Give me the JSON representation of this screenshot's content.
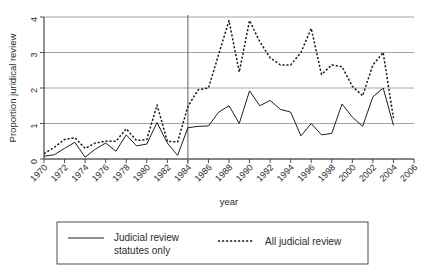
{
  "chart_data": {
    "type": "line",
    "title": "",
    "xlabel": "year",
    "ylabel": "Proportion juridical review",
    "xlim": [
      1970,
      2006
    ],
    "ylim": [
      0,
      4
    ],
    "grid": true,
    "legend_position": "bottom",
    "x_ticks": [
      1970,
      1972,
      1974,
      1976,
      1978,
      1980,
      1982,
      1984,
      1986,
      1988,
      1990,
      1992,
      1994,
      1996,
      1998,
      2000,
      2002,
      2004,
      2006
    ],
    "y_ticks": [
      0,
      1,
      2,
      3,
      4
    ],
    "annotations": [
      {
        "type": "vertical-line",
        "x": 1984,
        "label": ""
      }
    ],
    "x": [
      1970,
      1971,
      1972,
      1973,
      1974,
      1975,
      1976,
      1977,
      1978,
      1979,
      1980,
      1981,
      1982,
      1983,
      1984,
      1985,
      1986,
      1987,
      1988,
      1989,
      1990,
      1991,
      1992,
      1993,
      1994,
      1995,
      1996,
      1997,
      1998,
      1999,
      2000,
      2001,
      2002,
      2003,
      2004
    ],
    "series": [
      {
        "name": "Judicial review statutes only",
        "style": "solid",
        "values": [
          0.08,
          0.12,
          0.3,
          0.47,
          0.05,
          0.28,
          0.45,
          0.22,
          0.68,
          0.37,
          0.42,
          1.03,
          0.45,
          0.1,
          0.88,
          0.92,
          0.93,
          1.32,
          1.5,
          1.0,
          1.92,
          1.5,
          1.65,
          1.4,
          1.32,
          0.65,
          1.0,
          0.68,
          0.72,
          1.55,
          1.18,
          0.92,
          1.75,
          2.0,
          0.95
        ]
      },
      {
        "name": "All judicial review",
        "style": "dotted",
        "values": [
          0.15,
          0.33,
          0.55,
          0.6,
          0.3,
          0.45,
          0.5,
          0.5,
          0.85,
          0.52,
          0.55,
          1.52,
          0.5,
          0.48,
          1.48,
          1.95,
          2.0,
          2.95,
          3.9,
          2.45,
          3.9,
          3.3,
          2.85,
          2.65,
          2.65,
          3.0,
          3.68,
          2.38,
          2.65,
          2.6,
          2.05,
          1.78,
          2.65,
          3.0,
          1.15
        ]
      }
    ]
  },
  "axes": {
    "y_label": "Proportion juridical review",
    "x_label": "year",
    "y_tick_labels": [
      "0",
      "1",
      "2",
      "3",
      "4"
    ],
    "x_tick_labels": [
      "1970",
      "1972",
      "1974",
      "1976",
      "1978",
      "1980",
      "1982",
      "1984",
      "1986",
      "1988",
      "1990",
      "1992",
      "1994",
      "1996",
      "1998",
      "2000",
      "2002",
      "2004",
      "2006"
    ]
  },
  "legend": {
    "entries": [
      {
        "label_line1": "Judicial review",
        "label_line2": "statutes only",
        "style": "solid"
      },
      {
        "label_line1": "All judicial review",
        "label_line2": "",
        "style": "dotted"
      }
    ]
  },
  "colors": {
    "series_line": "#1f1f1f",
    "gridline": "#9a9a9a",
    "axis": "#3a3a3a",
    "reference_line": "#6b6b6b",
    "background": "#ffffff"
  }
}
